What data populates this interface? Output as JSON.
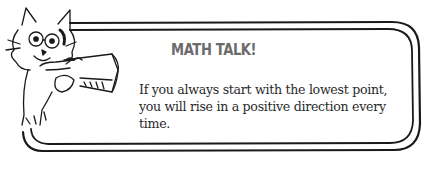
{
  "callout": {
    "title": "MATH TALK!",
    "body": "If you always start with the lowest point, you will rise in a positive direction every time.",
    "title_color": "#6b6b6b",
    "text_color": "#2a2a2a",
    "border_color": "#1a1a1a"
  },
  "mascot": {
    "icon": "cat-with-megaphone-icon"
  }
}
